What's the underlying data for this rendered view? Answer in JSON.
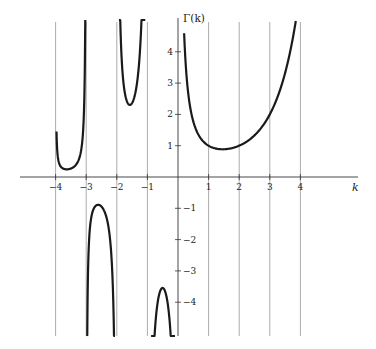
{
  "chart_data": {
    "type": "line",
    "title": "",
    "xlabel": "k",
    "ylabel": "Γ(k)",
    "xlim": [
      -5.8,
      5.8
    ],
    "ylim": [
      -5.0,
      5.5
    ],
    "x_ticks": [
      -4,
      -3,
      -2,
      -1,
      1,
      2,
      3,
      4
    ],
    "x_tick_labels": [
      "−4",
      "−3",
      "−2",
      "−1",
      "1",
      "2",
      "3",
      "4"
    ],
    "y_ticks": [
      4,
      3,
      2,
      1,
      -1,
      -2,
      -3,
      -4
    ],
    "y_tick_labels": [
      "4",
      "3",
      "2",
      "1",
      "−1",
      "−2",
      "−3",
      "−4"
    ],
    "grid": "vertical lines at integer k (−4..4)",
    "legend": null,
    "series": [
      {
        "name": "Γ(k), 0<k",
        "domain": [
          0.2,
          3.85
        ],
        "points": [
          [
            0.2,
            4.59
          ],
          [
            0.3,
            2.99
          ],
          [
            0.5,
            1.77
          ],
          [
            0.75,
            1.23
          ],
          [
            1,
            1.0
          ],
          [
            1.25,
            0.91
          ],
          [
            1.46,
            0.886
          ],
          [
            1.75,
            0.92
          ],
          [
            2,
            1.0
          ],
          [
            2.5,
            1.33
          ],
          [
            3,
            2.0
          ],
          [
            3.25,
            2.55
          ],
          [
            3.5,
            3.32
          ],
          [
            3.7,
            4.17
          ],
          [
            3.85,
            4.95
          ]
        ]
      },
      {
        "name": "Γ(k), −1<k<0",
        "domain": [
          -0.88,
          -0.1
        ],
        "points": [
          [
            -0.75,
            -4.83
          ],
          [
            -0.6,
            -3.7
          ],
          [
            -0.5,
            -3.545
          ],
          [
            -0.4,
            -3.72
          ],
          [
            -0.25,
            -4.9
          ]
        ]
      },
      {
        "name": "Γ(k), −2<k<−1",
        "domain": [
          -1.93,
          -1.07
        ],
        "points": [
          [
            -1.9,
            9.92
          ],
          [
            -1.75,
            4.27
          ],
          [
            -1.5,
            2.363
          ],
          [
            -1.25,
            3.625
          ],
          [
            -1.1,
            9.71
          ]
        ]
      },
      {
        "name": "Γ(k), −3<k<−2",
        "domain": [
          -2.97,
          -2.06
        ],
        "points": [
          [
            -2.9,
            -3.42
          ],
          [
            -2.75,
            -1.55
          ],
          [
            -2.5,
            -0.945
          ],
          [
            -2.25,
            -1.61
          ],
          [
            -2.1,
            -4.63
          ]
        ]
      },
      {
        "name": "Γ(k), −4<k<−3",
        "domain": [
          -3.97,
          -3.03
        ],
        "points": [
          [
            -3.9,
            0.88
          ],
          [
            -3.75,
            0.414
          ],
          [
            -3.5,
            0.27
          ],
          [
            -3.25,
            0.496
          ],
          [
            -3.1,
            1.49
          ]
        ]
      }
    ],
    "annotations": []
  },
  "style": {
    "curve_color": "#1a1a1a",
    "axis_color": "#333333",
    "grid_color": "#888888",
    "background": "#ffffff"
  }
}
